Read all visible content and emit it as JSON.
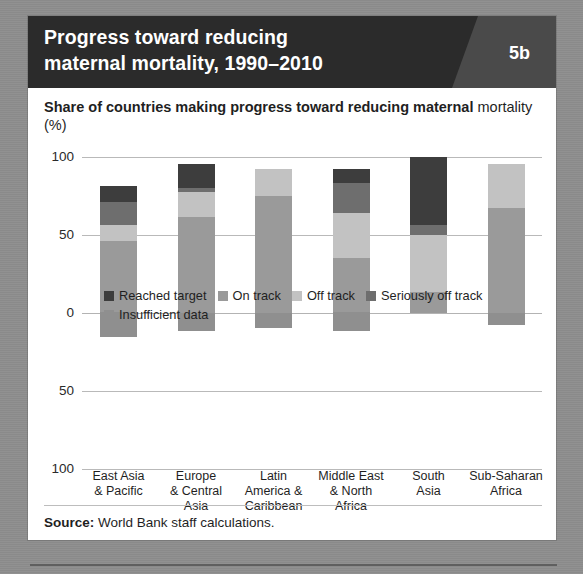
{
  "header": {
    "title": "Progress toward reducing\nmaternal mortality, 1990–2010",
    "badge": "5b"
  },
  "subtitle": {
    "text": "Share of countries making progress toward reducing maternal ",
    "unit": "mortality (%)"
  },
  "source": {
    "label": "Source:",
    "text": " World Bank staff calculations."
  },
  "colors": {
    "reached_target": "#3d3d3d",
    "on_track": "#9a9a9a",
    "off_track": "#c2c2c2",
    "seriously_off_track": "#6e6e6e",
    "insufficient_data": "#8f8f8f",
    "gridline": "#b9b9b9",
    "header_bg": "#2b2b2b",
    "badge_panel": "#4a4a4a",
    "page_bg": "#8d8d8d"
  },
  "chart_data": {
    "type": "bar",
    "title": "Progress toward reducing maternal mortality, 1990–2010",
    "subtitle": "Share of countries making progress toward reducing maternal mortality (%)",
    "stacked": true,
    "xlabel": "",
    "ylabel": "Share of countries (%)",
    "ylim": [
      -100,
      100
    ],
    "yticks": [
      100,
      50,
      0,
      -50,
      -100
    ],
    "ytick_labels": [
      "100",
      "50",
      "0",
      "50",
      "100"
    ],
    "grid": true,
    "legend_position": "bottom",
    "categories": [
      "East Asia\n& Pacific",
      "Europe\n& Central\nAsia",
      "Latin\nAmerica &\nCaribbean",
      "Middle East\n& North\nAfrica",
      "South\nAsia",
      "Sub-Saharan\nAfrica"
    ],
    "series": [
      {
        "name": "Reached target",
        "color": "#3d3d3d",
        "values": [
          10,
          15,
          0,
          9,
          44,
          0
        ]
      },
      {
        "name": "Seriously off track",
        "color": "#6e6e6e",
        "values": [
          15,
          3,
          0,
          19,
          6,
          0
        ]
      },
      {
        "name": "Off track",
        "color": "#c2c2c2",
        "values": [
          10,
          16,
          17,
          29,
          37,
          28
        ]
      },
      {
        "name": "On track",
        "color": "#9a9a9a",
        "values": [
          46,
          61,
          75,
          35,
          13,
          67
        ]
      },
      {
        "name": "Insufficient data",
        "color": "#8f8f8f",
        "values": [
          -16,
          -12,
          -10,
          -12,
          0,
          -8
        ]
      }
    ]
  },
  "legend": [
    {
      "label": "Reached target",
      "color": "#3d3d3d"
    },
    {
      "label": "On track",
      "color": "#9a9a9a"
    },
    {
      "label": "Off track",
      "color": "#c2c2c2"
    },
    {
      "label": "Seriously off track",
      "color": "#6e6e6e"
    },
    {
      "label": "Insufficient data",
      "color": "#8f8f8f"
    }
  ]
}
